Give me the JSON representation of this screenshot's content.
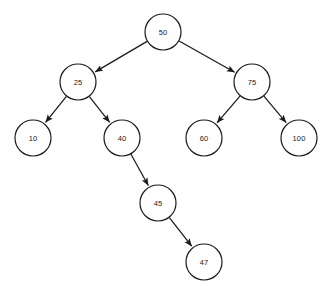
{
  "diagram": {
    "type": "binary-search-tree",
    "title": "",
    "canvas": {
      "width": 326,
      "height": 286,
      "background": "#ffffff"
    },
    "style": {
      "node_fill": "#ffffff",
      "node_stroke": "#1a1a1a",
      "node_radius": 18,
      "edge_stroke": "#1a1a1a",
      "edge_width": 1.25,
      "label_color": "#1a1a1a",
      "arrowhead": "filled-triangle"
    },
    "nodes": [
      {
        "id": "n50",
        "label": "50",
        "cx": 163,
        "cy": 32,
        "r": 18,
        "level": 0
      },
      {
        "id": "n25",
        "label": "25",
        "cx": 78,
        "cy": 82,
        "r": 18,
        "level": 1
      },
      {
        "id": "n75",
        "label": "75",
        "cx": 252,
        "cy": 82,
        "r": 18,
        "level": 1
      },
      {
        "id": "n10",
        "label": "10",
        "cx": 33,
        "cy": 138,
        "r": 18,
        "level": 2
      },
      {
        "id": "n40",
        "label": "40",
        "cx": 122,
        "cy": 138,
        "r": 18,
        "level": 2
      },
      {
        "id": "n60",
        "label": "60",
        "cx": 204,
        "cy": 138,
        "r": 18,
        "level": 2
      },
      {
        "id": "n100",
        "label": "100",
        "cx": 299,
        "cy": 138,
        "r": 18,
        "level": 2
      },
      {
        "id": "n45",
        "label": "45",
        "cx": 158,
        "cy": 203,
        "r": 18,
        "level": 3
      },
      {
        "id": "n47",
        "label": "47",
        "cx": 204,
        "cy": 262,
        "r": 18,
        "level": 4
      }
    ],
    "edges": [
      {
        "from": "n50",
        "to": "n25",
        "directed": true,
        "side": "left"
      },
      {
        "from": "n50",
        "to": "n75",
        "directed": true,
        "side": "right"
      },
      {
        "from": "n25",
        "to": "n10",
        "directed": true,
        "side": "left"
      },
      {
        "from": "n25",
        "to": "n40",
        "directed": true,
        "side": "right"
      },
      {
        "from": "n75",
        "to": "n60",
        "directed": true,
        "side": "left"
      },
      {
        "from": "n75",
        "to": "n100",
        "directed": true,
        "side": "right"
      },
      {
        "from": "n40",
        "to": "n45",
        "directed": true,
        "side": "right"
      },
      {
        "from": "n45",
        "to": "n47",
        "directed": true,
        "side": "right"
      }
    ]
  }
}
